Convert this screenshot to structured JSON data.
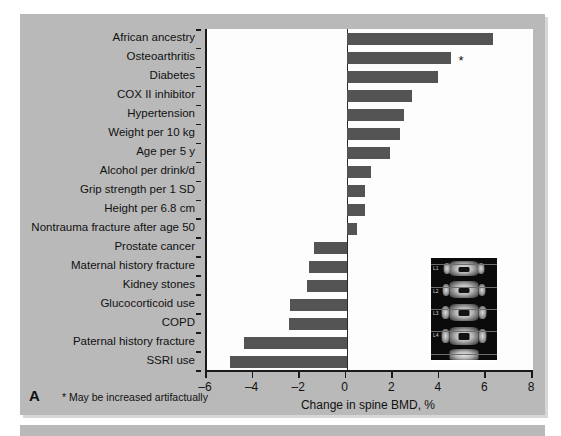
{
  "figure": {
    "panel_letter": "A",
    "footnote": "* May be increased artifactually",
    "asterisk_marker": "*"
  },
  "inset": {
    "name": "dxa-spine-scan",
    "vertebra_labels": [
      "L1",
      "L2",
      "L3",
      "L4"
    ]
  },
  "colors": {
    "panel_background": "#b9b9b9",
    "plot_background": "#fdfdfd",
    "bar": "#545454",
    "axis": "#1a1a1a"
  },
  "chart_data": {
    "type": "bar",
    "orientation": "horizontal",
    "title": "",
    "xlabel": "Change in spine BMD, %",
    "ylabel": "",
    "xlim": [
      -6,
      8
    ],
    "xticks": [
      -6,
      -4,
      -2,
      0,
      2,
      4,
      6,
      8
    ],
    "xtick_labels": [
      "–6",
      "–4",
      "–2",
      "0",
      "2",
      "4",
      "6",
      "8"
    ],
    "grid": false,
    "legend": "none",
    "zero_reference_line": 0,
    "categories": [
      "African ancestry",
      "Osteoarthritis",
      "Diabetes",
      "COX II inhibitor",
      "Hypertension",
      "Weight per 10 kg",
      "Age per 5 y",
      "Alcohol per drink/d",
      "Grip strength per 1 SD",
      "Height per 6.8 cm",
      "Nontrauma fracture after age 50",
      "Prostate cancer",
      "Maternal history fracture",
      "Kidney stones",
      "Glucocorticoid use",
      "COPD",
      "Paternal history fracture",
      "SSRI use"
    ],
    "values": [
      6.3,
      4.5,
      3.9,
      2.8,
      2.45,
      2.3,
      1.85,
      1.05,
      0.8,
      0.8,
      0.45,
      -1.4,
      -1.6,
      -1.7,
      -2.45,
      -2.5,
      -4.4,
      -5.0
    ],
    "annotations": [
      {
        "category": "Osteoarthritis",
        "marker": "*",
        "note": "May be increased artifactually"
      }
    ]
  }
}
